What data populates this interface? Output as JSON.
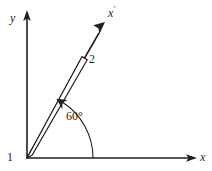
{
  "figure": {
    "type": "technical-diagram",
    "background_color": "#ffffff",
    "ink_color": "#231f20",
    "labels": {
      "y_axis": "y",
      "x_axis": "x",
      "x_prime_axis": "x",
      "x_prime_accent": "′",
      "rod_number": "2",
      "origin_number": "1",
      "angle": "60°"
    },
    "geometry": {
      "origin": {
        "x": 27,
        "y": 158
      },
      "y_axis_tip": {
        "x": 27,
        "y": 12
      },
      "x_axis_tip": {
        "x": 196,
        "y": 158
      },
      "x_prime_tip": {
        "x": 104,
        "y": 19
      },
      "x_prime_angle_deg": 60,
      "rod_length_px": 120,
      "rod_width_px": 6,
      "arc_radius_px": 66
    }
  }
}
